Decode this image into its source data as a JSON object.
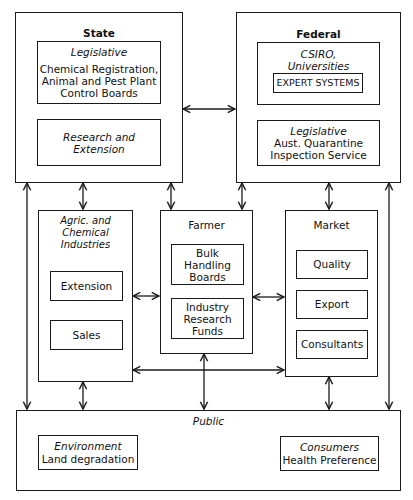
{
  "state": {
    "title": "State",
    "legislative": {
      "heading": "Legislative",
      "body": "Chemical Registration,\nAnimal and Pest Plant\nControl Boards"
    },
    "research": {
      "body": "Research and\nExtension"
    }
  },
  "federal": {
    "title": "Federal",
    "csiro": {
      "heading": "CSIRO,\nUniversities",
      "expert": "EXPERT SYSTEMS"
    },
    "legislative": {
      "heading": "Legislative",
      "body": "Aust. Quarantine\nInspection Service"
    }
  },
  "agric": {
    "title": "Agric. and Chemical\nIndustries",
    "items": [
      "Extension",
      "Sales"
    ]
  },
  "farmer": {
    "title": "Farmer",
    "items": [
      "Bulk\nHandling\nBoards",
      "Industry\nResearch\nFunds"
    ]
  },
  "market": {
    "title": "Market",
    "items": [
      "Quality",
      "Export",
      "Consultants"
    ]
  },
  "public": {
    "title": "Public",
    "environment": {
      "heading": "Environment",
      "body": "Land degradation"
    },
    "consumers": {
      "heading": "Consumers",
      "body": "Health Preference"
    }
  }
}
